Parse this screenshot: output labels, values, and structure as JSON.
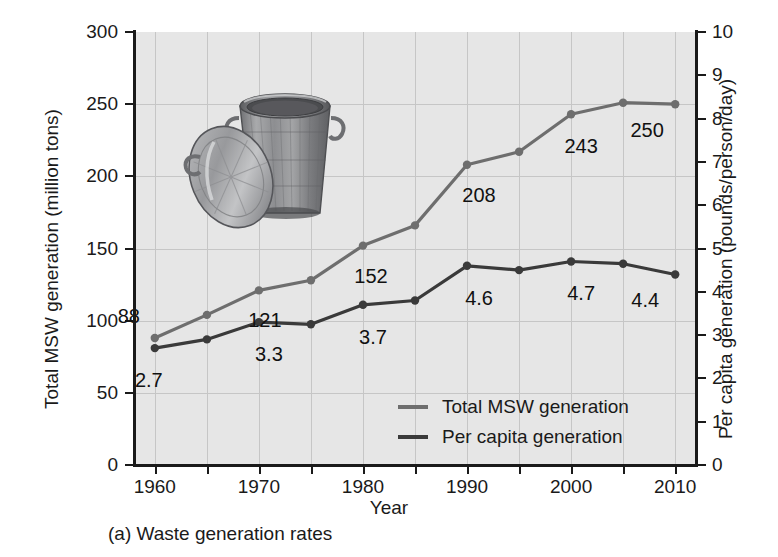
{
  "caption": "(a) Waste generation rates",
  "colors": {
    "total_line": "#6e6e6e",
    "percapita_line": "#3a3a3a",
    "plot_background": "#e6e6e6",
    "gridline": "#c6c6c6",
    "axis": "#1a1a1a",
    "text": "#1a1a1a"
  },
  "legend": {
    "position": "inside-bottom-center",
    "items": [
      {
        "label": "Total MSW generation",
        "color": "#6e6e6e"
      },
      {
        "label": "Per capita generation",
        "color": "#3a3a3a"
      }
    ]
  },
  "chart_data": {
    "type": "line",
    "title": "",
    "subtitle": "",
    "xlabel": "Year",
    "ylabel": "Total MSW generation (million tons)",
    "y2label": "Per capita generation (pounds/person/day)",
    "x": [
      1960,
      1965,
      1970,
      1975,
      1980,
      1985,
      1990,
      1995,
      2000,
      2005,
      2010
    ],
    "xlim": [
      1958,
      2012
    ],
    "xticks": [
      1960,
      1970,
      1980,
      1990,
      2000,
      2010
    ],
    "xticklabels": [
      "1960",
      "1970",
      "1980",
      "1990",
      "2000",
      "2010"
    ],
    "ylim": [
      0,
      300
    ],
    "yticks": [
      0,
      50,
      100,
      150,
      200,
      250,
      300
    ],
    "yticklabels": [
      "0",
      "50",
      "100",
      "150",
      "200",
      "250",
      "300"
    ],
    "y2lim": [
      0,
      10
    ],
    "y2ticks": [
      0,
      1,
      2,
      3,
      4,
      5,
      6,
      7,
      8,
      9,
      10
    ],
    "y2ticklabels": [
      "0",
      "1",
      "2",
      "3",
      "4",
      "5",
      "6",
      "7",
      "8",
      "9",
      "10"
    ],
    "grid": true,
    "legend_position": "inside-bottom-center",
    "series": [
      {
        "name": "Total MSW generation",
        "axis": "left",
        "color": "#6e6e6e",
        "marker": "circle",
        "values": [
          88,
          104,
          121,
          128,
          152,
          166,
          208,
          217,
          243,
          251,
          250
        ],
        "annotations": [
          {
            "x": 1960,
            "value": 88,
            "text": "88",
            "dx": -26,
            "dy": -22
          },
          {
            "x": 1970,
            "value": 121,
            "text": "121",
            "dx": 6,
            "dy": 30
          },
          {
            "x": 1980,
            "value": 152,
            "text": "152",
            "dx": 8,
            "dy": 30
          },
          {
            "x": 1990,
            "value": 208,
            "text": "208",
            "dx": 12,
            "dy": 30
          },
          {
            "x": 2000,
            "value": 243,
            "text": "243",
            "dx": 10,
            "dy": 32
          },
          {
            "x": 2010,
            "value": 250,
            "text": "250",
            "dx": -28,
            "dy": 26
          }
        ]
      },
      {
        "name": "Per capita generation",
        "axis": "right",
        "color": "#3a3a3a",
        "marker": "circle",
        "values": [
          2.7,
          2.9,
          3.3,
          3.25,
          3.7,
          3.8,
          4.6,
          4.5,
          4.7,
          4.65,
          4.4
        ],
        "annotations": [
          {
            "x": 1960,
            "value": 2.7,
            "text": "2.7",
            "dx": -6,
            "dy": 32
          },
          {
            "x": 1970,
            "value": 3.3,
            "text": "3.3",
            "dx": 10,
            "dy": 32
          },
          {
            "x": 1980,
            "value": 3.7,
            "text": "3.7",
            "dx": 10,
            "dy": 32
          },
          {
            "x": 1990,
            "value": 4.6,
            "text": "4.6",
            "dx": 12,
            "dy": 32
          },
          {
            "x": 2000,
            "value": 4.7,
            "text": "4.7",
            "dx": 10,
            "dy": 32
          },
          {
            "x": 2010,
            "value": 4.4,
            "text": "4.4",
            "dx": -30,
            "dy": 26
          }
        ]
      }
    ],
    "inset_image": {
      "name": "metal-trash-can-with-lid",
      "alt": "Galvanized metal trash can with lid"
    }
  }
}
